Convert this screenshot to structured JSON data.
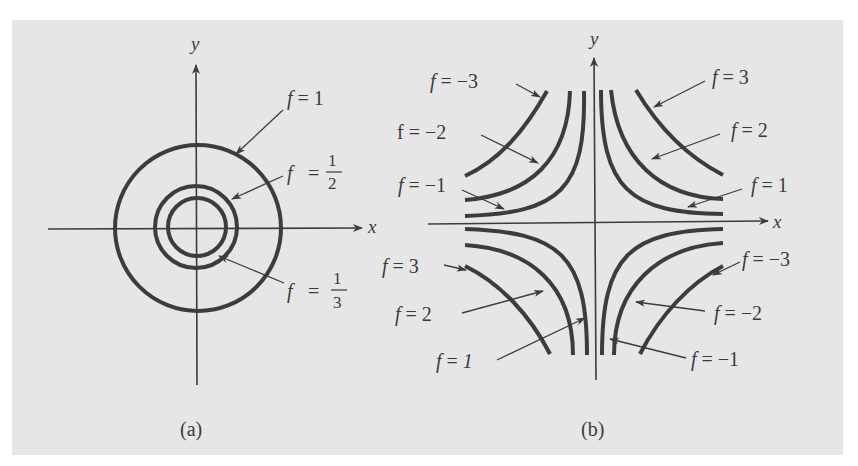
{
  "figure": {
    "background_color": "#e6e6e6",
    "curve_color": "#3c3c3c",
    "axis_color": "#3c3c3c",
    "panels": [
      {
        "id": "a",
        "caption": "(a)",
        "axes": {
          "x_label": "x",
          "y_label": "y"
        },
        "description": "Concentric circles as level curves",
        "level_curves": [
          {
            "label_var": "f",
            "label_eq": "=",
            "value": "1",
            "shape": "circle",
            "relative_radius": "largest"
          },
          {
            "label_var": "f",
            "label_eq": "=",
            "value_num": "1",
            "value_den": "2",
            "shape": "circle",
            "relative_radius": "middle"
          },
          {
            "label_var": "f",
            "label_eq": "=",
            "value_num": "1",
            "value_den": "3",
            "shape": "circle",
            "relative_radius": "smallest"
          }
        ]
      },
      {
        "id": "b",
        "caption": "(b)",
        "axes": {
          "x_label": "x",
          "y_label": "y"
        },
        "description": "Hyperbolic level curves in four quadrants",
        "labels": {
          "top_left": [
            {
              "var": "f",
              "eq": "=",
              "value": "−3"
            },
            {
              "var": "f",
              "eq": "=",
              "value": "−2"
            },
            {
              "var": "f",
              "eq": "=",
              "value": "−1"
            }
          ],
          "top_right": [
            {
              "var": "f",
              "eq": "=",
              "value": "3"
            },
            {
              "var": "f",
              "eq": "=",
              "value": "2"
            },
            {
              "var": "f",
              "eq": "=",
              "value": "1"
            }
          ],
          "bottom_left": [
            {
              "var": "f",
              "eq": "=",
              "value": "3"
            },
            {
              "var": "f",
              "eq": "=",
              "value": "2"
            },
            {
              "var": "f",
              "eq": "=",
              "value": "1"
            }
          ],
          "bottom_right": [
            {
              "var": "f",
              "eq": "=",
              "value": "−3"
            },
            {
              "var": "f",
              "eq": "=",
              "value": "−2"
            },
            {
              "var": "f",
              "eq": "=",
              "value": "−1"
            }
          ]
        }
      }
    ]
  }
}
